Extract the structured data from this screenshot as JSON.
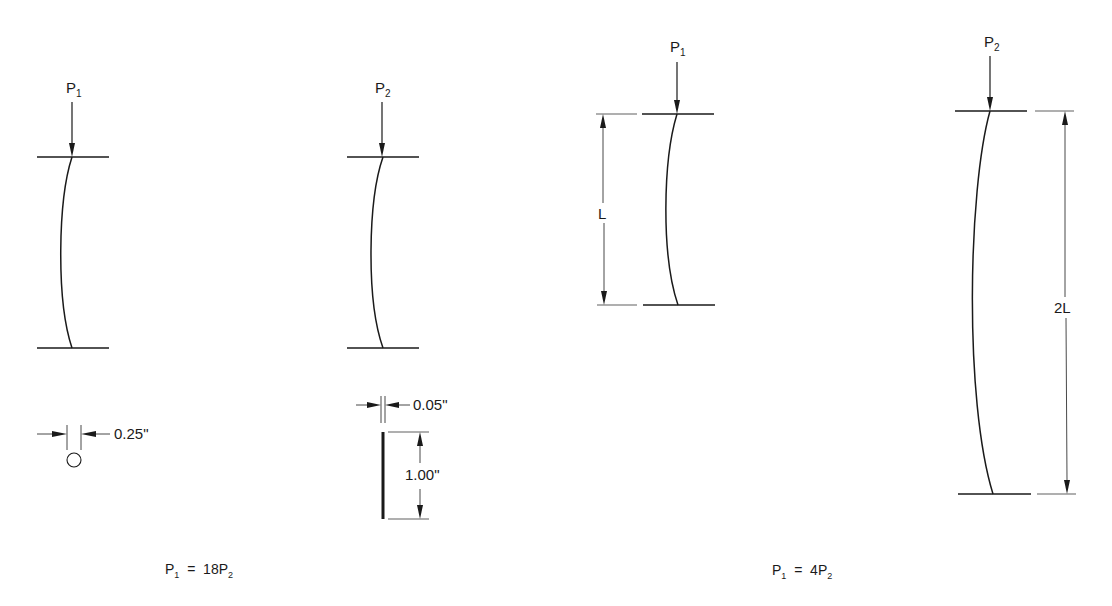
{
  "figure": {
    "colors": {
      "line": "#1a1a1a",
      "background": "#ffffff"
    }
  },
  "panel_left": {
    "column_a": {
      "load_base": "P",
      "load_sub": "1"
    },
    "column_b": {
      "load_base": "P",
      "load_sub": "2"
    },
    "section_a": {
      "shape": "circle",
      "dimension": "0.25\""
    },
    "section_b": {
      "shape": "thin-rectangle",
      "thickness": "0.05\"",
      "depth": "1.00\""
    },
    "relation": {
      "lhs_base": "P",
      "lhs_sub": "1",
      "op": "=",
      "rhs_coef": "18P",
      "rhs_sub": "2"
    }
  },
  "panel_right": {
    "column_a": {
      "load_base": "P",
      "load_sub": "1",
      "length": "L"
    },
    "column_b": {
      "load_base": "P",
      "load_sub": "2",
      "length": "2L"
    },
    "relation": {
      "lhs_base": "P",
      "lhs_sub": "1",
      "op": "=",
      "rhs_coef": "4P",
      "rhs_sub": "2"
    }
  }
}
